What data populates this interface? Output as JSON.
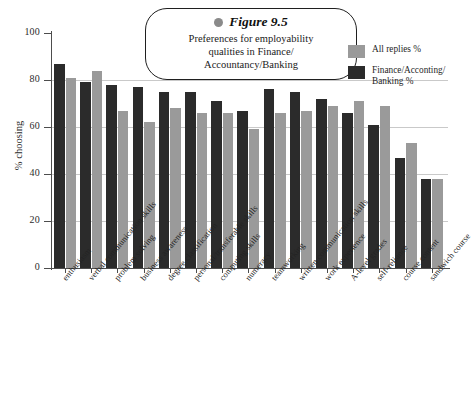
{
  "figure": {
    "dot_icon": "gray-dot-icon",
    "label": "Figure 9.5",
    "title": "Preferences for employability qualities in Finance/ Accountancy/Banking",
    "title_lines": [
      "Preferences for employability",
      "qualities in Finance/",
      "Accountancy/Banking"
    ]
  },
  "legend": {
    "position": "top-right",
    "entries": [
      {
        "label": "All replies %",
        "color": "#9a9a9a"
      },
      {
        "label": "Finance/Acconting/ Banking %",
        "color": "#2b2b2b"
      }
    ]
  },
  "axes": {
    "ylabel": "% choosing",
    "yticks": [
      "0",
      "20",
      "40",
      "60",
      "80",
      "100"
    ],
    "ymin": 0,
    "ymax": 100,
    "grid": true
  },
  "chart_data": {
    "type": "bar",
    "xlabel": "",
    "ylabel": "% choosing",
    "ylim": [
      0,
      100
    ],
    "grid": true,
    "legend_position": "top-right",
    "categories": [
      "enthusiasm",
      "verbal communication skills",
      "problem solving",
      "business awareness",
      "degree classification",
      "personal/transferable skills",
      "computing skills",
      "numeracy",
      "teamworking",
      "written communication skills",
      "work experience",
      "A-level grades",
      "self-reliance",
      "course content",
      "sandwich course"
    ],
    "series": [
      {
        "name": "Finance/Acconting/Banking %",
        "color": "#2b2b2b",
        "values": [
          87,
          79,
          78,
          77,
          75,
          75,
          71,
          67,
          76,
          75,
          72,
          66,
          61,
          47,
          38
        ]
      },
      {
        "name": "All replies %",
        "color": "#9a9a9a",
        "values": [
          81,
          84,
          67,
          62,
          68,
          66,
          66,
          59,
          66,
          67,
          69,
          71,
          69,
          53,
          38
        ]
      }
    ]
  },
  "bar_layout": {
    "group_pitch": 26.2,
    "group_offset": 2.0,
    "bar_width": 10.5,
    "bar_gap": 1.0
  }
}
